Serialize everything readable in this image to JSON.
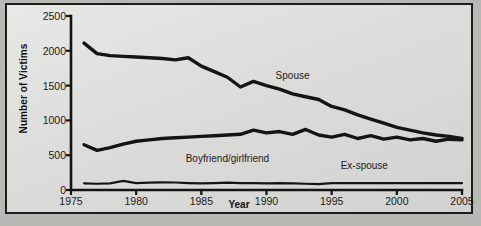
{
  "chart_data": {
    "type": "line",
    "title": "",
    "xlabel": "Year",
    "ylabel": "Number of Victims",
    "xlim": [
      1975,
      2005
    ],
    "ylim": [
      0,
      2500
    ],
    "yticks": [
      0,
      500,
      1000,
      1500,
      2000,
      2500
    ],
    "xticks": [
      1975,
      1980,
      1985,
      1990,
      1995,
      2000,
      2005
    ],
    "grid": false,
    "legend_position": "inline-annotations",
    "x": [
      1976,
      1977,
      1978,
      1979,
      1980,
      1981,
      1982,
      1983,
      1984,
      1985,
      1986,
      1987,
      1988,
      1989,
      1990,
      1991,
      1992,
      1993,
      1994,
      1995,
      1996,
      1997,
      1998,
      1999,
      2000,
      2001,
      2002,
      2003,
      2004,
      2005
    ],
    "series": [
      {
        "name": "Spouse",
        "label": "Spouse",
        "color": "#141414",
        "values": [
          2110,
          1960,
          1930,
          1920,
          1910,
          1900,
          1890,
          1870,
          1900,
          1780,
          1700,
          1620,
          1480,
          1560,
          1500,
          1450,
          1380,
          1340,
          1300,
          1200,
          1150,
          1080,
          1020,
          960,
          900,
          860,
          820,
          790,
          770,
          740
        ]
      },
      {
        "name": "Boyfriend/girlfriend",
        "label": "Boyfriend/girlfriend",
        "color": "#141414",
        "values": [
          650,
          570,
          610,
          660,
          700,
          720,
          740,
          750,
          760,
          770,
          780,
          790,
          800,
          860,
          820,
          840,
          800,
          870,
          790,
          760,
          800,
          740,
          780,
          730,
          760,
          720,
          740,
          700,
          730,
          720
        ]
      },
      {
        "name": "Ex-spouse",
        "label": "Ex-spouse",
        "color": "#141414",
        "values": [
          95,
          90,
          95,
          130,
          100,
          105,
          110,
          108,
          100,
          95,
          100,
          105,
          100,
          98,
          95,
          100,
          95,
          90,
          85,
          100,
          100,
          100,
          100,
          100,
          100,
          100,
          100,
          100,
          100,
          100
        ]
      }
    ],
    "annotations": [
      {
        "text": "Spouse",
        "x": 1992,
        "y": 1620
      },
      {
        "text": "Boyfriend/girlfriend",
        "x": 1987,
        "y": 430
      },
      {
        "text": "Ex-spouse",
        "x": 1997.5,
        "y": 330
      }
    ]
  }
}
